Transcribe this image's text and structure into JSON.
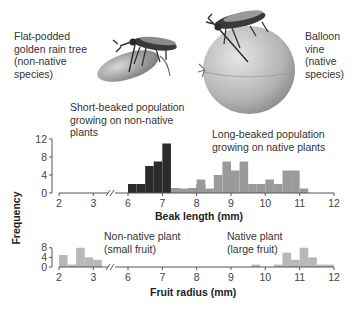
{
  "illustration": {
    "left_label": [
      "Flat-podded",
      "golden rain tree",
      "(non-native",
      "species)"
    ],
    "right_label": [
      "Balloon",
      "vine",
      "(native",
      "species)"
    ],
    "left_icon": "bug-on-flat-pod-icon",
    "right_icon": "bug-on-balloon-fruit-icon"
  },
  "chart_data": [
    {
      "type": "bar",
      "title": "",
      "xlabel": "Beak length (mm)",
      "ylabel": "Frequency",
      "ylim": [
        0,
        12
      ],
      "yticks": [
        "0",
        "4",
        "8",
        "12"
      ],
      "xticks": [
        "2",
        "3",
        "6",
        "7",
        "8",
        "9",
        "10",
        "11",
        "12"
      ],
      "axis_break": "between 3 and 6",
      "grid": false,
      "annotations": [
        "Short-beaked population growing on non-native plants",
        "Long-beaked population growing on native plants"
      ],
      "series": [
        {
          "name": "Short-beaked population growing on non-native plants",
          "color": "#2b2b2b",
          "bins": [
            {
              "x0": 6.0,
              "x1": 6.25,
              "value": 2
            },
            {
              "x0": 6.25,
              "x1": 6.5,
              "value": 2
            },
            {
              "x0": 6.5,
              "x1": 6.75,
              "value": 6
            },
            {
              "x0": 6.75,
              "x1": 7.0,
              "value": 7
            },
            {
              "x0": 7.0,
              "x1": 7.25,
              "value": 11
            },
            {
              "x0": 7.25,
              "x1": 7.5,
              "value": 1
            },
            {
              "x0": 7.75,
              "x1": 8.0,
              "value": 1
            },
            {
              "x0": 8.0,
              "x1": 8.25,
              "value": 2
            }
          ]
        },
        {
          "name": "Long-beaked population growing on native plants",
          "color": "#9a9a9a",
          "bins": [
            {
              "x0": 7.25,
              "x1": 7.5,
              "value": 1
            },
            {
              "x0": 7.5,
              "x1": 7.75,
              "value": 1
            },
            {
              "x0": 7.75,
              "x1": 8.0,
              "value": 1
            },
            {
              "x0": 8.0,
              "x1": 8.25,
              "value": 3
            },
            {
              "x0": 8.25,
              "x1": 8.5,
              "value": 1
            },
            {
              "x0": 8.5,
              "x1": 8.75,
              "value": 4
            },
            {
              "x0": 8.75,
              "x1": 9.0,
              "value": 7
            },
            {
              "x0": 9.0,
              "x1": 9.25,
              "value": 5
            },
            {
              "x0": 9.25,
              "x1": 9.5,
              "value": 7
            },
            {
              "x0": 9.5,
              "x1": 9.75,
              "value": 2
            },
            {
              "x0": 9.75,
              "x1": 10.0,
              "value": 2
            },
            {
              "x0": 10.0,
              "x1": 10.25,
              "value": 3
            },
            {
              "x0": 10.25,
              "x1": 10.5,
              "value": 2
            },
            {
              "x0": 10.5,
              "x1": 10.75,
              "value": 5
            },
            {
              "x0": 10.75,
              "x1": 11.0,
              "value": 5
            },
            {
              "x0": 11.0,
              "x1": 11.25,
              "value": 1
            }
          ]
        }
      ]
    },
    {
      "type": "bar",
      "title": "",
      "xlabel": "Fruit radius (mm)",
      "ylabel": "Frequency",
      "ylim": [
        0,
        8
      ],
      "yticks": [
        "0",
        "4",
        "8"
      ],
      "xticks": [
        "2",
        "3",
        "6",
        "7",
        "8",
        "9",
        "10",
        "11",
        "12"
      ],
      "axis_break": "between 3 and 6",
      "grid": false,
      "annotations": [
        "Non-native plant (small fruit)",
        "Native plant (large fruit)"
      ],
      "series": [
        {
          "name": "Non-native plant (small fruit)",
          "color": "#b8b8b8",
          "bins": [
            {
              "x0": 2.0,
              "x1": 2.25,
              "value": 5
            },
            {
              "x0": 2.25,
              "x1": 2.5,
              "value": 1
            },
            {
              "x0": 2.5,
              "x1": 2.75,
              "value": 8
            },
            {
              "x0": 2.75,
              "x1": 3.0,
              "value": 4
            },
            {
              "x0": 3.0,
              "x1": 3.25,
              "value": 3
            }
          ]
        },
        {
          "name": "Native plant (large fruit)",
          "color": "#b8b8b8",
          "bins": [
            {
              "x0": 9.6,
              "x1": 9.85,
              "value": 1
            },
            {
              "x0": 10.25,
              "x1": 10.5,
              "value": 1
            },
            {
              "x0": 10.5,
              "x1": 10.75,
              "value": 6
            },
            {
              "x0": 10.75,
              "x1": 11.0,
              "value": 3
            },
            {
              "x0": 11.0,
              "x1": 11.25,
              "value": 8
            },
            {
              "x0": 11.25,
              "x1": 11.5,
              "value": 4
            },
            {
              "x0": 11.5,
              "x1": 11.75,
              "value": 1
            },
            {
              "x0": 11.75,
              "x1": 12.0,
              "value": 1
            }
          ]
        }
      ]
    }
  ],
  "labels": {
    "top_left_annotation": [
      "Short-beaked population",
      "growing on non-native",
      "plants"
    ],
    "top_right_annotation": [
      "Long-beaked population",
      "growing on native plants"
    ],
    "bottom_left_annotation": [
      "Non-native plant",
      "(small fruit)"
    ],
    "bottom_right_annotation": [
      "Native plant",
      "(large fruit)"
    ],
    "top_xlabel": "Beak length (mm)",
    "bottom_xlabel": "Fruit radius (mm)",
    "ylabel": "Frequency"
  },
  "colors": {
    "short_beaked": "#2b2b2b",
    "long_beaked": "#9a9a9a",
    "fruit": "#b8b8b8",
    "axis": "#555555"
  }
}
